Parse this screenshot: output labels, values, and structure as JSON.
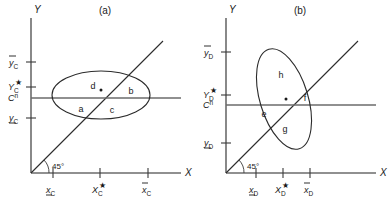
{
  "figure": {
    "type": "diagram",
    "background_color": "#ffffff",
    "line_color": "#2b2b2b",
    "axis_color": "#6b6b6b"
  },
  "panels": [
    {
      "id": "a",
      "title": "(a)",
      "axis": {
        "x_label": "X",
        "y_label": "Y",
        "origin_angle_label": "45°"
      },
      "y_ticks": [
        {
          "key": "ybar",
          "base": "y",
          "sub": "C",
          "decoration": "overbar",
          "value_y": 62
        },
        {
          "key": "ystar",
          "base": "Y",
          "sub": "C",
          "decoration": "star",
          "value_y": 87
        },
        {
          "key": "cn",
          "base": "C",
          "sup": "n",
          "decoration": "superscript",
          "value_y": 98
        },
        {
          "key": "yunder",
          "base": "y",
          "sub": "C",
          "decoration": "underbar",
          "value_y": 118
        }
      ],
      "x_ticks": [
        {
          "key": "xunder",
          "base": "x",
          "sub": "C",
          "decoration": "underbar",
          "value_x": 53
        },
        {
          "key": "xstar",
          "base": "X",
          "sub": "C",
          "decoration": "star",
          "value_x": 100
        },
        {
          "key": "xbar",
          "base": "x",
          "sub": "C",
          "decoration": "overbar",
          "value_x": 148
        }
      ],
      "ellipse": {
        "orientation": "horizontal",
        "center_x": 101,
        "center_y": 95,
        "rx": 49,
        "ry": 24,
        "rotation": 0
      },
      "region_labels": [
        {
          "text": "d",
          "x": 93,
          "y": 89
        },
        {
          "text": "b",
          "x": 131,
          "y": 94
        },
        {
          "text": "a",
          "x": 81,
          "y": 112
        },
        {
          "text": "c",
          "x": 112,
          "y": 113
        }
      ]
    },
    {
      "id": "b",
      "title": "(b)",
      "axis": {
        "x_label": "X",
        "y_label": "Y",
        "origin_angle_label": "45°"
      },
      "y_ticks": [
        {
          "key": "ybar",
          "base": "y",
          "sub": "D",
          "decoration": "overbar",
          "value_y": 52
        },
        {
          "key": "ystar",
          "base": "Y",
          "sub": "D",
          "decoration": "star",
          "value_y": 95
        },
        {
          "key": "cn",
          "base": "C",
          "sup": "n",
          "decoration": "superscript",
          "value_y": 105
        },
        {
          "key": "yunder",
          "base": "y",
          "sub": "D",
          "decoration": "underbar",
          "value_y": 143
        }
      ],
      "x_ticks": [
        {
          "key": "xunder",
          "base": "x",
          "sub": "D",
          "decoration": "underbar",
          "value_x": 61
        },
        {
          "key": "xstar",
          "base": "X",
          "sub": "D",
          "decoration": "star",
          "value_x": 88
        },
        {
          "key": "xbar",
          "base": "x",
          "sub": "D",
          "decoration": "overbar",
          "value_x": 115
        }
      ],
      "ellipse": {
        "orientation": "tilted",
        "center_x": 89,
        "center_y": 99,
        "rx": 24,
        "ry": 52,
        "rotation": -17
      },
      "region_labels": [
        {
          "text": "h",
          "x": 86,
          "y": 78
        },
        {
          "text": "f",
          "x": 110,
          "y": 99
        },
        {
          "text": "e",
          "x": 69,
          "y": 115
        },
        {
          "text": "g",
          "x": 90,
          "y": 130
        }
      ]
    }
  ]
}
